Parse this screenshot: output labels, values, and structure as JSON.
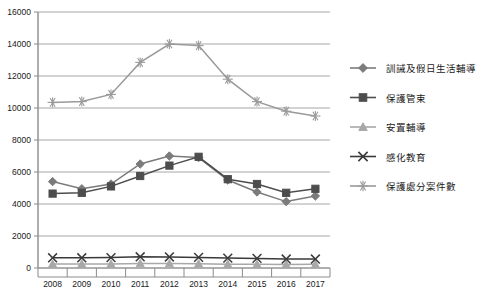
{
  "chart_data": {
    "type": "line",
    "title": "",
    "xlabel": "",
    "ylabel": "",
    "categories": [
      "2008",
      "2009",
      "2010",
      "2011",
      "2012",
      "2013",
      "2014",
      "2015",
      "2016",
      "2017"
    ],
    "ylim": [
      0,
      16000
    ],
    "ytick_step": 2000,
    "yticks": [
      "0",
      "2000",
      "4000",
      "6000",
      "8000",
      "10000",
      "12000",
      "14000",
      "16000"
    ],
    "grid": true,
    "legend_position": "right",
    "series": [
      {
        "name": "訓誡及假日生活輔導",
        "marker": "diamond",
        "color": "#7b7b7b",
        "values": [
          5400,
          4950,
          5250,
          6500,
          7000,
          6900,
          5500,
          4750,
          4150,
          4500
        ]
      },
      {
        "name": "保護管束",
        "marker": "square",
        "color": "#4d4d4d",
        "values": [
          4650,
          4700,
          5100,
          5750,
          6400,
          6950,
          5550,
          5250,
          4700,
          4950
        ]
      },
      {
        "name": "安置輔導",
        "marker": "triangle",
        "color": "#a8a8a8",
        "values": [
          250,
          250,
          250,
          280,
          280,
          260,
          240,
          230,
          220,
          230
        ]
      },
      {
        "name": "感化教育",
        "marker": "cross",
        "color": "#3a3a3a",
        "values": [
          640,
          640,
          650,
          700,
          690,
          660,
          620,
          600,
          560,
          560
        ]
      },
      {
        "name": "保護處分案件數",
        "marker": "star",
        "color": "#9a9a9a",
        "values": [
          10350,
          10400,
          10850,
          12850,
          14000,
          13900,
          11800,
          10400,
          9800,
          9500
        ]
      }
    ]
  },
  "colors": {
    "plot_border": "#8c8c8c",
    "gridline": "#a6a6a6",
    "axis": "#8c8c8c",
    "text": "#1a1a1a",
    "background": "#ffffff"
  }
}
